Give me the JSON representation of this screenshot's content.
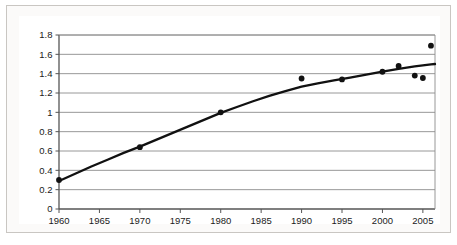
{
  "chart_data": {
    "type": "scatter",
    "title": "",
    "subtitle": "",
    "xlabel": "",
    "ylabel": "",
    "xlim": [
      1960,
      2006.5
    ],
    "ylim": [
      0,
      1.8
    ],
    "grid": "horizontal",
    "legend": "none",
    "x_ticks": [
      1960,
      1965,
      1970,
      1975,
      1980,
      1985,
      1990,
      1995,
      2000,
      2005
    ],
    "x_tick_labels": [
      "1960",
      "1965",
      "1970",
      "1975",
      "1980",
      "1985",
      "1990",
      "1995",
      "2000",
      "2005"
    ],
    "y_ticks": [
      0,
      0.2,
      0.4,
      0.6,
      0.8,
      1,
      1.2,
      1.4,
      1.6,
      1.8
    ],
    "y_tick_labels": [
      "0",
      "0.2",
      "0.4",
      "0.6",
      "0.8",
      "1",
      "1.2",
      "1.4",
      "1.6",
      "1.8"
    ],
    "series": [
      {
        "name": "observed-points",
        "type": "scatter",
        "marker": "filled-circle",
        "color": "#111111",
        "points": [
          {
            "x": 1960,
            "y": 0.3
          },
          {
            "x": 1970,
            "y": 0.64
          },
          {
            "x": 1980,
            "y": 1.0
          },
          {
            "x": 1990,
            "y": 1.35
          },
          {
            "x": 1995,
            "y": 1.34
          },
          {
            "x": 2000,
            "y": 1.42
          },
          {
            "x": 2002,
            "y": 1.48
          },
          {
            "x": 2004,
            "y": 1.38
          },
          {
            "x": 2005,
            "y": 1.355
          },
          {
            "x": 2006,
            "y": 1.69
          }
        ]
      },
      {
        "name": "fitted-trend-curve",
        "type": "line",
        "color": "#111111",
        "points": [
          {
            "x": 1960,
            "y": 0.29
          },
          {
            "x": 1962,
            "y": 0.365
          },
          {
            "x": 1964,
            "y": 0.44
          },
          {
            "x": 1966,
            "y": 0.51
          },
          {
            "x": 1968,
            "y": 0.58
          },
          {
            "x": 1970,
            "y": 0.645
          },
          {
            "x": 1972,
            "y": 0.715
          },
          {
            "x": 1974,
            "y": 0.785
          },
          {
            "x": 1976,
            "y": 0.855
          },
          {
            "x": 1978,
            "y": 0.925
          },
          {
            "x": 1980,
            "y": 0.995
          },
          {
            "x": 1982,
            "y": 1.055
          },
          {
            "x": 1984,
            "y": 1.115
          },
          {
            "x": 1986,
            "y": 1.17
          },
          {
            "x": 1988,
            "y": 1.22
          },
          {
            "x": 1990,
            "y": 1.265
          },
          {
            "x": 1992,
            "y": 1.3
          },
          {
            "x": 1994,
            "y": 1.33
          },
          {
            "x": 1996,
            "y": 1.36
          },
          {
            "x": 1998,
            "y": 1.39
          },
          {
            "x": 2000,
            "y": 1.42
          },
          {
            "x": 2002,
            "y": 1.45
          },
          {
            "x": 2004,
            "y": 1.475
          },
          {
            "x": 2006,
            "y": 1.497
          },
          {
            "x": 2006.5,
            "y": 1.5
          }
        ]
      }
    ]
  }
}
